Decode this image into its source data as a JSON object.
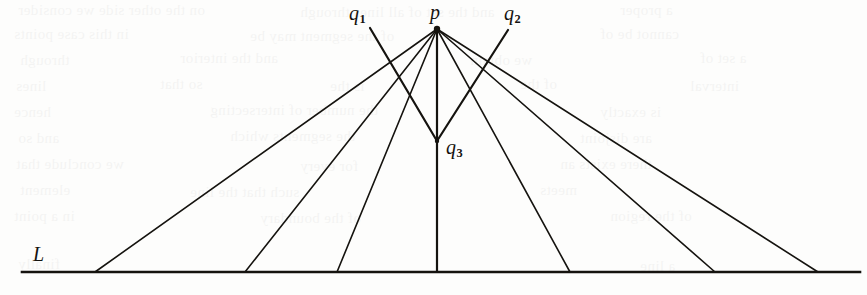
{
  "figure": {
    "caption_labels": {
      "p": {
        "text": "p",
        "sub": ""
      },
      "q1": {
        "text": "q",
        "sub": "1"
      },
      "q2": {
        "text": "q",
        "sub": "2"
      },
      "q3": {
        "text": "q",
        "sub": "3"
      },
      "L": {
        "text": "L",
        "sub": ""
      }
    },
    "colors": {
      "ink": "#15130f",
      "paper": "#fdfdfc",
      "bleed": "#000000"
    },
    "geometry": {
      "apex_p": {
        "x": 437,
        "y": 29
      },
      "vertex_q3": {
        "x": 437,
        "y": 141
      },
      "q1_endpoint": {
        "x": 370,
        "y": 28
      },
      "q2_endpoint": {
        "x": 508,
        "y": 30
      },
      "baseline": {
        "y": 272,
        "x_start": 22,
        "x_end": 860
      },
      "feet": [
        95,
        245,
        337,
        437,
        570,
        715,
        818
      ],
      "line_width_rays": 1.6,
      "line_width_baseline": 2.6,
      "line_width_emphasis": 2.2
    }
  },
  "bleed_through": {
    "lines": [
      {
        "x": 18,
        "y": 2,
        "text": "on the other side we consider"
      },
      {
        "x": 300,
        "y": 4,
        "text": "and the set of all lines through"
      },
      {
        "x": 620,
        "y": 2,
        "text": "a proper"
      },
      {
        "x": 14,
        "y": 26,
        "text": "in this case points"
      },
      {
        "x": 250,
        "y": 28,
        "text": "of the segment may be"
      },
      {
        "x": 600,
        "y": 26,
        "text": "cannot be of"
      },
      {
        "x": 20,
        "y": 52,
        "text": "through"
      },
      {
        "x": 180,
        "y": 50,
        "text": "and the interior"
      },
      {
        "x": 470,
        "y": 52,
        "text": "we obtain"
      },
      {
        "x": 700,
        "y": 50,
        "text": "a set of"
      },
      {
        "x": 16,
        "y": 78,
        "text": "lines"
      },
      {
        "x": 160,
        "y": 76,
        "text": "so that"
      },
      {
        "x": 330,
        "y": 78,
        "text": "is the"
      },
      {
        "x": 520,
        "y": 76,
        "text": "of the"
      },
      {
        "x": 690,
        "y": 78,
        "text": "interval"
      },
      {
        "x": 14,
        "y": 104,
        "text": "hence"
      },
      {
        "x": 210,
        "y": 102,
        "text": "the number of intersecting"
      },
      {
        "x": 600,
        "y": 104,
        "text": "is exactly"
      },
      {
        "x": 18,
        "y": 130,
        "text": "and so"
      },
      {
        "x": 230,
        "y": 128,
        "text": "the segments which"
      },
      {
        "x": 580,
        "y": 130,
        "text": "are disjoint"
      },
      {
        "x": 16,
        "y": 156,
        "text": "we conclude that"
      },
      {
        "x": 300,
        "y": 158,
        "text": "for every"
      },
      {
        "x": 560,
        "y": 156,
        "text": "there exists an"
      },
      {
        "x": 20,
        "y": 182,
        "text": "element"
      },
      {
        "x": 190,
        "y": 184,
        "text": "such that the line"
      },
      {
        "x": 540,
        "y": 182,
        "text": "meets"
      },
      {
        "x": 14,
        "y": 208,
        "text": "in a point"
      },
      {
        "x": 260,
        "y": 210,
        "text": "of the boundary"
      },
      {
        "x": 610,
        "y": 208,
        "text": "of the region"
      },
      {
        "x": 18,
        "y": 256,
        "text": "finally"
      },
      {
        "x": 640,
        "y": 258,
        "text": "a line"
      }
    ]
  }
}
